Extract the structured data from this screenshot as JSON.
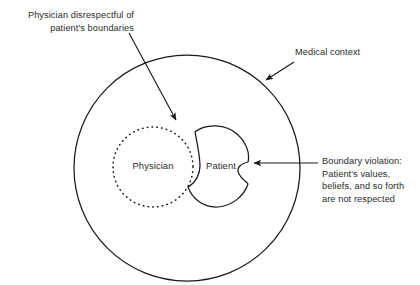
{
  "diagram": {
    "type": "venn-annotation-diagram",
    "background_color": "#ffffff",
    "stroke_color": "#1a1a1a",
    "text_color": "#2b2b2b"
  },
  "shapes": {
    "outer_circle": {
      "name": "Medical context",
      "style": "solid",
      "cx": 187,
      "cy": 168,
      "r": 113
    },
    "physician_circle": {
      "name": "Physician",
      "style": "dotted",
      "cx": 153,
      "cy": 167,
      "r": 40
    },
    "patient_shape": {
      "name": "Patient",
      "style": "solid-blob-with-notch"
    }
  },
  "labels": {
    "physician": "Physician",
    "patient": "Patient",
    "medical_context": "Medical context",
    "physician_disrespect": "Physician disrespectful of\npatient's boundaries",
    "boundary_violation": "Boundary violation:\nPatient's values,\nbeliefs, and so forth\nare not respected"
  },
  "annotations": [
    {
      "id": "arrow-disrespect",
      "from_label": "physician_disrespect",
      "points_to": "physician_circle",
      "direction": "down-right"
    },
    {
      "id": "arrow-medical-context",
      "from_label": "medical_context",
      "points_to": "outer_circle",
      "direction": "down-left"
    },
    {
      "id": "arrow-boundary-violation",
      "from_label": "boundary_violation",
      "points_to": "patient_shape",
      "direction": "left"
    }
  ]
}
